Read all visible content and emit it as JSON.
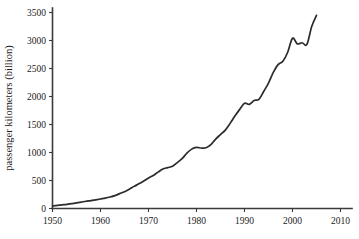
{
  "chart_data": {
    "type": "line",
    "title": "",
    "subtitle": "",
    "xlabel": "",
    "ylabel": "passenger kilometers (billion)",
    "xlim": [
      1948,
      2012
    ],
    "ylim": [
      0,
      3600
    ],
    "grid": false,
    "legend": null,
    "legend_position": "none",
    "xticks": [
      1950,
      1960,
      1970,
      1980,
      1990,
      2000,
      2010
    ],
    "xtick_labels": [
      "1950",
      "1960",
      "1970",
      "1980",
      "1990",
      "2000",
      "2010"
    ],
    "yticks": [
      0,
      500,
      1000,
      1500,
      2000,
      2500,
      3000,
      3500
    ],
    "ytick_labels": [
      "0",
      "500",
      "1000",
      "1500",
      "2000",
      "2500",
      "3000",
      "3500"
    ],
    "series": [
      {
        "name": "World air travel",
        "color": "#2b2b2b",
        "x": [
          1950,
          1951,
          1952,
          1953,
          1954,
          1955,
          1956,
          1957,
          1958,
          1959,
          1960,
          1961,
          1962,
          1963,
          1964,
          1965,
          1966,
          1967,
          1968,
          1969,
          1970,
          1971,
          1972,
          1973,
          1974,
          1975,
          1976,
          1977,
          1978,
          1979,
          1980,
          1981,
          1982,
          1983,
          1984,
          1985,
          1986,
          1987,
          1988,
          1989,
          1990,
          1991,
          1992,
          1993,
          1994,
          1995,
          1996,
          1997,
          1998,
          1999,
          2000,
          2001,
          2002,
          2003,
          2004,
          2005
        ],
        "values": [
          45,
          55,
          65,
          75,
          88,
          100,
          115,
          130,
          140,
          155,
          170,
          185,
          205,
          230,
          265,
          300,
          345,
          395,
          440,
          490,
          545,
          590,
          650,
          705,
          730,
          755,
          820,
          890,
          990,
          1060,
          1090,
          1080,
          1085,
          1140,
          1240,
          1320,
          1400,
          1520,
          1650,
          1770,
          1880,
          1860,
          1930,
          1950,
          2090,
          2240,
          2430,
          2570,
          2630,
          2790,
          3040,
          2940,
          2960,
          2930,
          3250,
          3450
        ]
      }
    ],
    "annotations": []
  },
  "axis": {
    "y_title": "passenger kilometers (billion)"
  }
}
